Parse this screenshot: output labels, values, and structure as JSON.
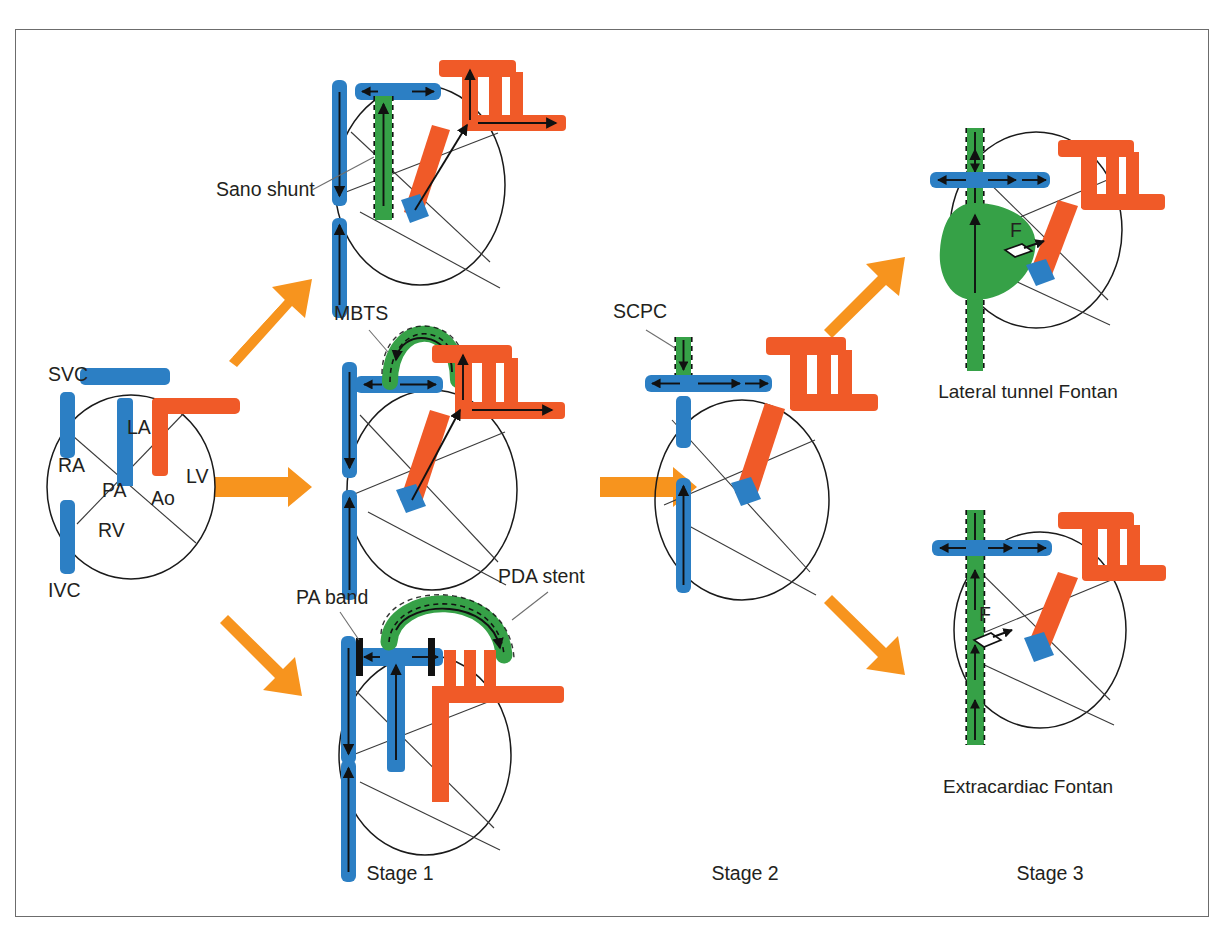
{
  "figure": {
    "background": "#ffffff",
    "frame_color": "#6c6c6c"
  },
  "colors": {
    "venous_blue": "#2C7FC4",
    "arterial_orange": "#F05A28",
    "graft_green": "#36A147",
    "graft_green_dark": "#1f7a2e",
    "flow_arrow_orange": "#F7941E",
    "outline_black": "#1a1a1a",
    "text": "#231f20",
    "leader_gray": "#6e6e6e"
  },
  "anatomy_labels": {
    "svc": "SVC",
    "ivc": "IVC",
    "ra": "RA",
    "rv": "RV",
    "la": "LA",
    "lv": "LV",
    "pa": "PA",
    "ao": "Ao"
  },
  "stage_labels": [
    {
      "id": "stage-1",
      "text": "Stage 1",
      "x": 400,
      "y": 880
    },
    {
      "id": "stage-2",
      "text": "Stage 2",
      "x": 745,
      "y": 880
    },
    {
      "id": "stage-3",
      "text": "Stage 3",
      "x": 1050,
      "y": 880
    }
  ],
  "panels": [
    {
      "id": "native-heart",
      "stage": "Native",
      "callouts": [],
      "caption": ""
    },
    {
      "id": "sano-shunt",
      "stage": "Stage 1",
      "callouts": [
        {
          "id": "sano-shunt-label",
          "text": "Sano shunt",
          "x": 216,
          "y": 196
        }
      ],
      "caption": ""
    },
    {
      "id": "mbts",
      "stage": "Stage 1",
      "callouts": [
        {
          "id": "mbts-label",
          "text": "MBTS",
          "x": 334,
          "y": 320
        }
      ],
      "caption": ""
    },
    {
      "id": "pa-band-pda-stent",
      "stage": "Stage 1",
      "callouts": [
        {
          "id": "pa-band-label",
          "text": "PA band",
          "x": 296,
          "y": 604
        },
        {
          "id": "pda-stent-label",
          "text": "PDA stent",
          "x": 500,
          "y": 583
        }
      ],
      "caption": ""
    },
    {
      "id": "scpc",
      "stage": "Stage 2",
      "callouts": [
        {
          "id": "scpc-label",
          "text": "SCPC",
          "x": 613,
          "y": 318
        }
      ],
      "caption": ""
    },
    {
      "id": "lateral-tunnel-fontan",
      "stage": "Stage 3",
      "callouts": [
        {
          "id": "fenestration-label-lt",
          "text": "F",
          "x": 1010,
          "y": 237
        }
      ],
      "caption": "Lateral tunnel Fontan",
      "caption_x": 1028,
      "caption_y": 398
    },
    {
      "id": "extracardiac-fontan",
      "stage": "Stage 3",
      "callouts": [
        {
          "id": "fenestration-label-ec",
          "text": "F",
          "x": 979,
          "y": 621
        }
      ],
      "caption": "Extracardiac Fontan",
      "caption_x": 1028,
      "caption_y": 793
    }
  ],
  "flow_arrows": [
    {
      "id": "arrow-native-to-sano",
      "from": "native-heart",
      "to": "sano-shunt",
      "direction": "up-right"
    },
    {
      "id": "arrow-native-to-mbts",
      "from": "native-heart",
      "to": "mbts",
      "direction": "right"
    },
    {
      "id": "arrow-native-to-pa-band",
      "from": "native-heart",
      "to": "pa-band-pda-stent",
      "direction": "down-right"
    },
    {
      "id": "arrow-stage1-to-scpc",
      "from": "mbts",
      "to": "scpc",
      "direction": "right"
    },
    {
      "id": "arrow-scpc-to-lateral-tunnel",
      "from": "scpc",
      "to": "lateral-tunnel-fontan",
      "direction": "up-right"
    },
    {
      "id": "arrow-scpc-to-extracardiac",
      "from": "scpc",
      "to": "extracardiac-fontan",
      "direction": "down-right"
    }
  ]
}
